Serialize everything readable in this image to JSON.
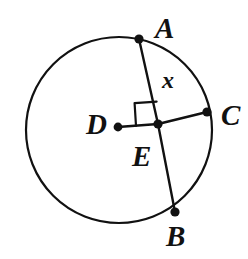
{
  "figure": {
    "kind": "circle-geometry-diagram",
    "background_color": "#ffffff",
    "stroke_color": "#111111",
    "canvas": {
      "width": 248,
      "height": 259
    }
  },
  "labels": {
    "a": "A",
    "b": "B",
    "c": "C",
    "d": "D",
    "e": "E",
    "x": "x"
  },
  "geometry": {
    "circle": {
      "cx": 119,
      "cy": 130,
      "r": 93,
      "stroke_width": 2.2
    },
    "points": [
      {
        "name": "A",
        "x": 139,
        "y": 39,
        "on_circle": true,
        "dot_radius": 4.6
      },
      {
        "name": "B",
        "x": 175,
        "y": 212,
        "on_circle": true,
        "dot_radius": 4.6
      },
      {
        "name": "C",
        "x": 207,
        "y": 112,
        "on_circle": true,
        "dot_radius": 4.6
      },
      {
        "name": "D",
        "x": 118,
        "y": 127,
        "on_circle": false,
        "dot_radius": 4.4,
        "role": "center"
      },
      {
        "name": "E",
        "x": 158,
        "y": 124,
        "on_circle": false,
        "dot_radius": 4.6,
        "role": "intersection"
      }
    ],
    "segments": [
      {
        "name": "chord-AB",
        "from": "A",
        "to": "B",
        "stroke_width": 2.4
      },
      {
        "name": "radius-DC",
        "from": "D",
        "to": "C",
        "stroke_width": 2.4
      }
    ],
    "right_angle_marker": {
      "at": "E",
      "quadrant": "upper-left",
      "size": 23,
      "stroke_width": 2.2
    }
  }
}
